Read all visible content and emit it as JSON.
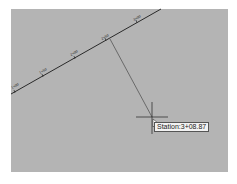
{
  "viewport": {
    "background": "#b4b4b4",
    "alignment": {
      "color": "#2a2a2a",
      "station_labels": [
        "1+00",
        "1+50",
        "2+00",
        "2+50",
        "3+00",
        "3+50"
      ]
    },
    "leader": {
      "color": "#555555"
    },
    "crosshair": {
      "color": "#333333"
    },
    "tooltip": {
      "text": "Station:3+08.87"
    },
    "cursor_icon": "arrow-pointer-icon"
  }
}
